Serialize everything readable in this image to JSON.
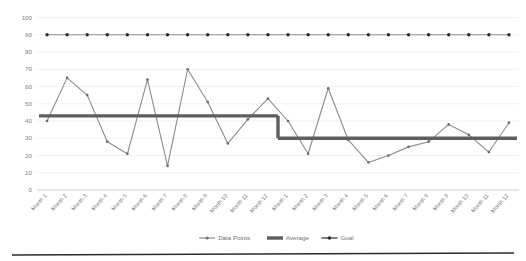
{
  "chart_data": {
    "type": "line",
    "title": "",
    "xlabel": "",
    "ylabel": "",
    "ylim": [
      0,
      100
    ],
    "ytick_step": 10,
    "yticks": [
      0,
      10,
      20,
      30,
      40,
      50,
      60,
      70,
      80,
      90,
      100
    ],
    "grid": true,
    "legend_position": "bottom",
    "categories": [
      "Month 1",
      "Month 2",
      "Month 3",
      "Month 4",
      "Month 5",
      "Month 6",
      "Month 7",
      "Month 8",
      "Month 9",
      "Month 10",
      "Month 11",
      "Month 12",
      "Month 1",
      "Month 2",
      "Month 3",
      "Month 4",
      "Month 5",
      "Month 6",
      "Month 7",
      "Month 8",
      "Month 9",
      "Month 10",
      "Month 11",
      "Month 12"
    ],
    "series": [
      {
        "name": "Data Points",
        "color": "#8b8b8b",
        "marker": "circle",
        "values": [
          40,
          65,
          55,
          28,
          21,
          64,
          14,
          70,
          51,
          27,
          41,
          53,
          40,
          21,
          59,
          29,
          16,
          20,
          25,
          28,
          38,
          32,
          22,
          39
        ]
      },
      {
        "name": "Average",
        "color": "#5e5e5e",
        "marker": "none",
        "values": [
          43,
          43,
          43,
          43,
          43,
          43,
          43,
          43,
          43,
          43,
          43,
          43,
          30,
          30,
          30,
          30,
          30,
          30,
          30,
          30,
          30,
          30,
          30,
          30
        ]
      },
      {
        "name": "Goal",
        "color": "#2b2b2b",
        "marker": "circle",
        "values": [
          90,
          90,
          90,
          90,
          90,
          90,
          90,
          90,
          90,
          90,
          90,
          90,
          90,
          90,
          90,
          90,
          90,
          90,
          90,
          90,
          90,
          90,
          90,
          90
        ]
      }
    ],
    "legend": [
      {
        "label": "Data Points",
        "color": "#8b8b8b",
        "marker": "circle"
      },
      {
        "label": "Average",
        "color": "#5e5e5e",
        "marker": "none"
      },
      {
        "label": "Goal",
        "color": "#2b2b2b",
        "marker": "circle"
      }
    ]
  }
}
